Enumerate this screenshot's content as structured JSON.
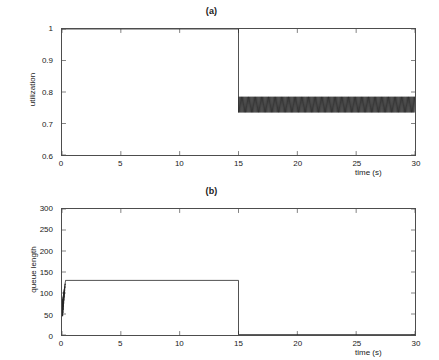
{
  "figure": {
    "background": "#ffffff",
    "line_color": "#262626",
    "axis_color": "#4d4d4d"
  },
  "chart_data": [
    {
      "type": "line",
      "title": "(a)",
      "xlabel": "time (s)",
      "ylabel": "utilization",
      "xlim": [
        0,
        30
      ],
      "ylim": [
        0.6,
        1.0
      ],
      "xticks": [
        0,
        5,
        10,
        15,
        20,
        25,
        30
      ],
      "xticklabels": [
        "0",
        "5",
        "10",
        "15",
        "20",
        "25",
        "30"
      ],
      "yticks": [
        0.6,
        0.7,
        0.8,
        0.9,
        1.0
      ],
      "yticklabels": [
        "0.6",
        "0.7",
        "0.8",
        "0.9",
        "1"
      ],
      "grid": false,
      "legend": null,
      "annotations": [
        "Step change at t = 15 s",
        "Segment 1 (0-15 s): utilization saturated at 1.0",
        "Segment 2 (15-30 s): utilization oscillates rapidly in a dense band"
      ],
      "series": [
        {
          "name": "utilization",
          "segments": [
            {
              "x_start": 0,
              "x_end": 15,
              "mode": "constant",
              "value": 1.0
            },
            {
              "x_start": 15,
              "x_end": 30,
              "mode": "oscillation",
              "band_min": 0.735,
              "band_max": 0.785,
              "mean": 0.76,
              "cycles": 150
            }
          ]
        }
      ]
    },
    {
      "type": "line",
      "title": "(b)",
      "xlabel": "time (s)",
      "ylabel": "queue length",
      "xlim": [
        0,
        30
      ],
      "ylim": [
        0,
        300
      ],
      "xticks": [
        0,
        5,
        10,
        15,
        20,
        25,
        30
      ],
      "xticklabels": [
        "0",
        "5",
        "10",
        "15",
        "20",
        "25",
        "30"
      ],
      "yticks": [
        0,
        50,
        100,
        150,
        200,
        250,
        300
      ],
      "yticklabels": [
        "0",
        "50",
        "100",
        "150",
        "200",
        "250",
        "300"
      ],
      "grid": false,
      "legend": null,
      "annotations": [
        "Startup transient near t = 0 rising from about 50 to 130",
        "Plateau at about 130 packets for 0-15 s",
        "Queue drains to about 0 at t = 15 s and stays near 0"
      ],
      "series": [
        {
          "name": "queue length",
          "segments": [
            {
              "x_start": 0,
              "x_end": 0.3,
              "mode": "transient",
              "value_start": 50,
              "value_end": 130,
              "band_min": 45,
              "band_max": 132
            },
            {
              "x_start": 0.3,
              "x_end": 15,
              "mode": "constant",
              "value": 130
            },
            {
              "x_start": 15,
              "x_end": 30,
              "mode": "constant",
              "value": 1
            }
          ]
        }
      ]
    }
  ]
}
